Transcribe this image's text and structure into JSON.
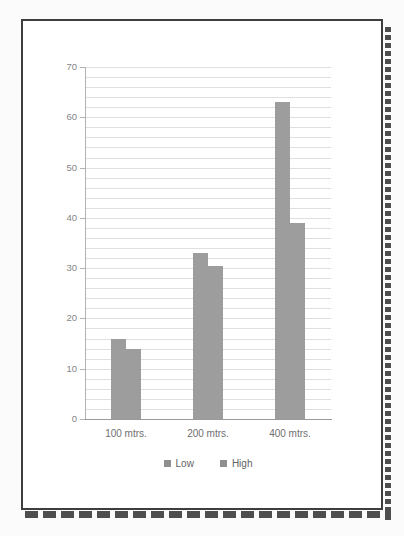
{
  "page": {
    "canvas_color": "#fbfbfb",
    "paper_color": "#ffffff",
    "frame_color": "#3e3e3e",
    "stitch_color": "#4e4e4e"
  },
  "chart_data": {
    "type": "bar",
    "title": "",
    "xlabel": "",
    "ylabel": "",
    "categories": [
      "100 mtrs.",
      "200 mtrs.",
      "400 mtrs."
    ],
    "series": [
      {
        "name": "Low",
        "values": [
          16,
          33,
          63
        ]
      },
      {
        "name": "High",
        "values": [
          14,
          30.5,
          39
        ]
      }
    ],
    "ylim": [
      0,
      70
    ],
    "y_major_ticks": [
      "0",
      "10",
      "20",
      "30",
      "40",
      "50",
      "60",
      "70"
    ],
    "y_major_step": 10,
    "y_minor_step": 2,
    "grid": true,
    "legend_position": "bottom",
    "bar_color": "#9d9d9d",
    "legend_marker_color": "#8f8f8f",
    "gridline_color": "#dfdfdf",
    "axis_color": "#b3b3b3",
    "x_axis_color": "#9a9a9a",
    "tick_label_color": "#858585",
    "category_label_color": "#6f6f6f",
    "legend_label_color": "#5f5f5f"
  }
}
